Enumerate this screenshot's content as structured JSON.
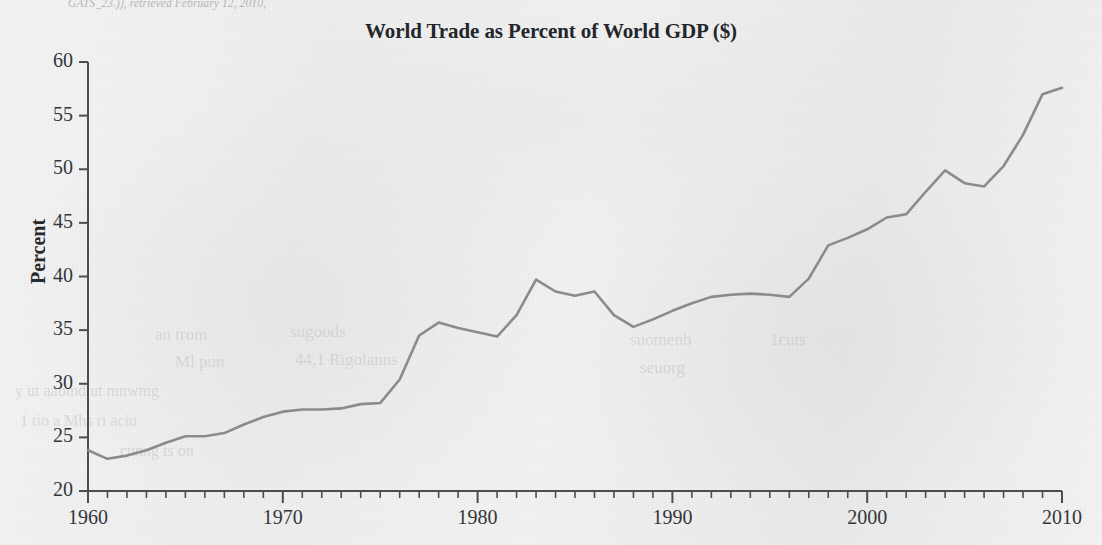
{
  "page": {
    "header_partial_text": "GATS_23.)), retrieved February 12, 2010,",
    "background_color": "#efefef"
  },
  "chart_data": {
    "type": "line",
    "title": "World Trade as Percent of World GDP ($)",
    "xlabel": "",
    "ylabel": "Percent",
    "xlim": [
      1960,
      2010
    ],
    "ylim": [
      20,
      60
    ],
    "xticks": [
      1960,
      1970,
      1980,
      1990,
      2000,
      2010
    ],
    "xtick_labels": [
      "1960",
      "1970",
      "1980",
      "1990",
      "2000",
      "2010"
    ],
    "yticks": [
      20,
      25,
      30,
      35,
      40,
      45,
      50,
      55,
      60
    ],
    "ytick_labels": [
      "20",
      "25",
      "30",
      "35",
      "40",
      "45",
      "50",
      "55",
      "60"
    ],
    "minor_xtick_interval": 1,
    "grid": false,
    "legend": false,
    "line_color": "#8b8b8b",
    "line_width": 2.6,
    "x": [
      1960,
      1961,
      1962,
      1963,
      1964,
      1965,
      1966,
      1967,
      1968,
      1969,
      1970,
      1971,
      1972,
      1973,
      1974,
      1975,
      1976,
      1977,
      1978,
      1979,
      1980,
      1981,
      1982,
      1983,
      1984,
      1985,
      1986,
      1987,
      1988,
      1989,
      1990,
      1991,
      1992,
      1993,
      1994,
      1995,
      1996,
      1997,
      1998,
      1999,
      2000,
      2001,
      2002,
      2003,
      2004,
      2005,
      2006,
      2007,
      2008,
      2009,
      2010
    ],
    "values": [
      23.8,
      23.0,
      23.3,
      23.8,
      24.5,
      25.1,
      25.1,
      25.4,
      26.2,
      26.9,
      27.4,
      27.6,
      27.6,
      27.7,
      28.1,
      28.2,
      30.4,
      34.5,
      35.7,
      35.2,
      34.8,
      34.4,
      36.4,
      39.7,
      38.6,
      38.2,
      38.6,
      36.4,
      35.3,
      36.0,
      36.8,
      37.5,
      38.1,
      38.3,
      38.4,
      38.3,
      38.1,
      39.8,
      42.9,
      43.6,
      44.4,
      45.5,
      45.8,
      47.9,
      49.9,
      48.7,
      48.4,
      50.3,
      53.2,
      57.0,
      57.6
    ]
  }
}
